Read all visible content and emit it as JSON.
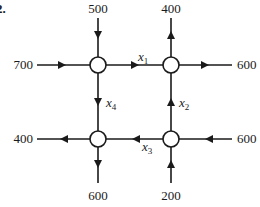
{
  "problem_number": "2.",
  "diagram": {
    "type": "traffic-flow-network",
    "nodes": [
      {
        "id": "TL",
        "x": 98,
        "y": 65
      },
      {
        "id": "TR",
        "x": 171,
        "y": 65
      },
      {
        "id": "BL",
        "x": 98,
        "y": 139
      },
      {
        "id": "BR",
        "x": 171,
        "y": 139
      }
    ],
    "external_flows": [
      {
        "id": "in-top-left",
        "label": "500",
        "node": "TL",
        "direction": "in",
        "side": "top"
      },
      {
        "id": "out-top-right",
        "label": "400",
        "node": "TR",
        "direction": "out",
        "side": "top"
      },
      {
        "id": "in-left-top",
        "label": "700",
        "node": "TL",
        "direction": "in",
        "side": "left"
      },
      {
        "id": "out-right-top",
        "label": "600",
        "node": "TR",
        "direction": "out",
        "side": "right"
      },
      {
        "id": "out-left-bottom",
        "label": "400",
        "node": "BL",
        "direction": "out",
        "side": "left"
      },
      {
        "id": "in-right-bottom",
        "label": "600",
        "node": "BR",
        "direction": "in",
        "side": "right"
      },
      {
        "id": "out-bottom-left",
        "label": "600",
        "node": "BL",
        "direction": "out",
        "side": "bottom"
      },
      {
        "id": "in-bottom-right",
        "label": "200",
        "node": "BR",
        "direction": "in",
        "side": "bottom"
      }
    ],
    "internal_flows": [
      {
        "id": "x1",
        "var": "x",
        "sub": "1",
        "from": "TL",
        "to": "TR"
      },
      {
        "id": "x2",
        "var": "x",
        "sub": "2",
        "from": "BR",
        "to": "TR"
      },
      {
        "id": "x3",
        "var": "x",
        "sub": "3",
        "from": "BR",
        "to": "BL"
      },
      {
        "id": "x4",
        "var": "x",
        "sub": "4",
        "from": "TL",
        "to": "BL"
      }
    ]
  }
}
